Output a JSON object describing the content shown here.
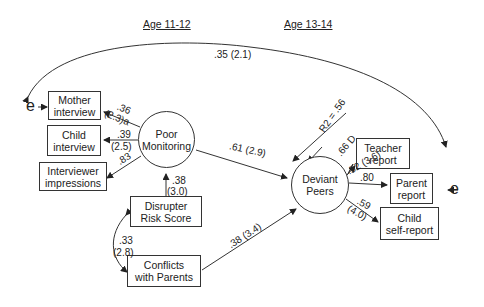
{
  "headers": {
    "left": "Age 11-12",
    "right": "Age 13-14"
  },
  "nodes": {
    "mother_interview": [
      "Mother",
      "interview"
    ],
    "child_interview": [
      "Child",
      "interview"
    ],
    "interviewer_impressions": [
      "Interviewer",
      "impressions"
    ],
    "poor_monitoring": [
      "Poor",
      "Monitoring"
    ],
    "disrupter_risk": [
      "Disrupter",
      "Risk Score"
    ],
    "conflicts_parents": [
      "Conflicts",
      "with Parents"
    ],
    "deviant_peers": [
      "Deviant",
      "Peers"
    ],
    "teacher_report": [
      "Teacher",
      "report"
    ],
    "parent_report": [
      "Parent",
      "report"
    ],
    "child_self_report": [
      "Child",
      "self-report"
    ]
  },
  "error_terms": {
    "left": "e",
    "right": "e"
  },
  "paths": {
    "error_covariance": ".35 (2.1)",
    "pm_mother_a": ".36",
    "pm_mother_b": "(2.3)a",
    "pm_child_a": ".39",
    "pm_child_b": "(2.5)",
    "pm_interviewer": ".83",
    "pm_to_dp": ".61 (2.9)",
    "drs_to_pm_a": ".38",
    "drs_to_pm_b": "(3.0)",
    "drs_cwp_a": ".33",
    "drs_cwp_b": "(2.8)",
    "cwp_to_dp": ".38 (3.4)",
    "r2": "R2 = .56",
    "disturbance": ".66 D",
    "dp_teacher": ".52 (3.6)",
    "dp_parent": ".80",
    "dp_child_a": ".59",
    "dp_child_b": "(4.0)"
  }
}
